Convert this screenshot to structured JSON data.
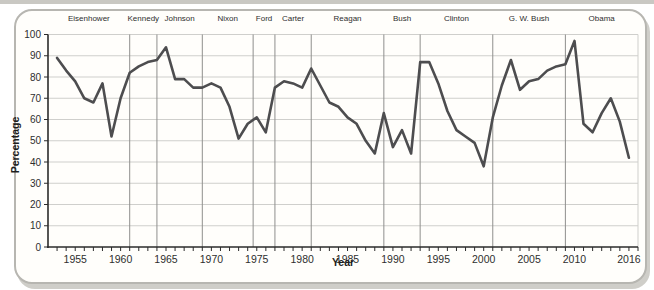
{
  "chart_data": {
    "type": "line",
    "title": "",
    "xlabel": "Year",
    "ylabel": "Percentage",
    "x_domain": [
      1952,
      2017
    ],
    "ylim": [
      0,
      100
    ],
    "grid": true,
    "y_ticks": [
      0,
      10,
      20,
      30,
      40,
      50,
      60,
      70,
      80,
      90,
      100
    ],
    "x_tick_labels": [
      1955,
      1960,
      1965,
      1970,
      1975,
      1980,
      1985,
      1990,
      1995,
      2000,
      2005,
      2010,
      2016
    ],
    "x_minor_tick_range": [
      1953,
      2017
    ],
    "president_eras": [
      {
        "name": "Eisenhower",
        "start": 1952,
        "end": 1961
      },
      {
        "name": "Kennedy",
        "start": 1961,
        "end": 1964
      },
      {
        "name": "Johnson",
        "start": 1964,
        "end": 1969
      },
      {
        "name": "Nixon",
        "start": 1969,
        "end": 1974.6
      },
      {
        "name": "Ford",
        "start": 1974.6,
        "end": 1977
      },
      {
        "name": "Carter",
        "start": 1977,
        "end": 1981
      },
      {
        "name": "Reagan",
        "start": 1981,
        "end": 1989
      },
      {
        "name": "Bush",
        "start": 1989,
        "end": 1993
      },
      {
        "name": "Clinton",
        "start": 1993,
        "end": 2001
      },
      {
        "name": "G. W. Bush",
        "start": 2001,
        "end": 2009
      },
      {
        "name": "Obama",
        "start": 2009,
        "end": 2017
      }
    ],
    "x": [
      1953,
      1954,
      1955,
      1956,
      1957,
      1958,
      1959,
      1960,
      1961,
      1962,
      1963,
      1964,
      1965,
      1966,
      1967,
      1968,
      1969,
      1970,
      1971,
      1972,
      1973,
      1974,
      1975,
      1976,
      1977,
      1978,
      1979,
      1980,
      1981,
      1982,
      1983,
      1984,
      1985,
      1986,
      1987,
      1988,
      1989,
      1990,
      1991,
      1992,
      1993,
      1994,
      1995,
      1996,
      1997,
      1998,
      1999,
      2000,
      2001,
      2002,
      2003,
      2004,
      2005,
      2006,
      2007,
      2008,
      2009,
      2010,
      2011,
      2012,
      2013,
      2014,
      2015,
      2016
    ],
    "values": [
      89,
      83,
      78,
      70,
      68,
      77,
      52,
      70,
      82,
      85,
      87,
      88,
      94,
      79,
      79,
      75,
      75,
      77,
      75,
      66,
      51,
      58,
      61,
      54,
      75,
      78,
      77,
      75,
      84,
      76,
      68,
      66,
      61,
      58,
      50,
      44,
      63,
      47,
      55,
      44,
      87,
      87,
      77,
      64,
      55,
      52,
      49,
      38,
      61,
      76,
      88,
      74,
      78,
      79,
      83,
      85,
      86,
      97,
      58,
      54,
      63,
      70,
      59,
      42
    ],
    "colors": {
      "line": "#4d4d4f",
      "gridline": "#cfcfcc",
      "era_boundary": "#8f8f8d",
      "axis": "#2b2b2b"
    }
  }
}
